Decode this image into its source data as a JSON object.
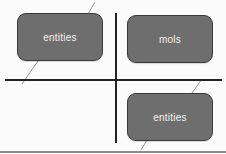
{
  "diagram": {
    "nodes": [
      {
        "id": "node-1",
        "label": "entities"
      },
      {
        "id": "node-2",
        "label": "mols"
      },
      {
        "id": "node-3",
        "label": "entities"
      }
    ],
    "colors": {
      "node_fill": "#6e6e6e",
      "node_border": "#3a3a3a",
      "node_text": "#f2f2f2",
      "divider": "#222222",
      "connector": "#7a7a7a",
      "background": "#fbfbfb"
    }
  }
}
